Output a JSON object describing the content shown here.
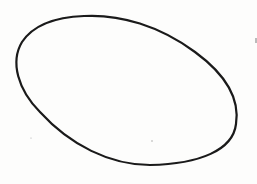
{
  "figure": {
    "shape": "ellipse",
    "stroke_color": "#1a1a1a",
    "background_color": "#fdfdfc",
    "stroke_width": 2.2
  }
}
